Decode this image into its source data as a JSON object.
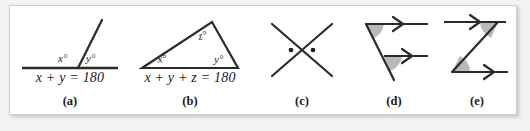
{
  "figure": {
    "background_color": "#f2f2f2",
    "panel_color": "#ffffff",
    "border_color": "#cfcfcf",
    "ink_color": "#2b2b2b",
    "shade_color": "#b9b9b9",
    "panels": [
      {
        "id": "a",
        "caption": "(a)",
        "equation": "x + y = 180",
        "concept": "linear-pair-on-a-line",
        "angle_labels": [
          "x°",
          "y°"
        ],
        "marks": "none"
      },
      {
        "id": "b",
        "caption": "(b)",
        "equation": "x + y + z = 180",
        "concept": "triangle-angle-sum",
        "angle_labels": [
          "x°",
          "y°",
          "z°"
        ],
        "marks": "none"
      },
      {
        "id": "c",
        "caption": "(c)",
        "equation": "",
        "concept": "vertical-angles-crossed-lines",
        "angle_labels": [],
        "marks": "two-dots"
      },
      {
        "id": "d",
        "caption": "(d)",
        "equation": "",
        "concept": "corresponding-angles-parallel-rays",
        "angle_labels": [],
        "marks": "two-shaded-wedges-two-arrow-rays"
      },
      {
        "id": "e",
        "caption": "(e)",
        "equation": "",
        "concept": "alternate-interior-angles-z-shape",
        "angle_labels": [],
        "marks": "two-shaded-wedges-two-arrow-rays"
      }
    ]
  }
}
